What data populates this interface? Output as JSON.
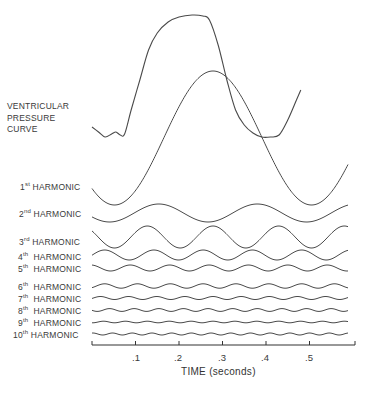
{
  "chart_data": {
    "type": "line",
    "title": "",
    "xlabel": "TIME (seconds)",
    "ylabel": "",
    "xlim": [
      0,
      0.59
    ],
    "x_ticks": [
      ".1",
      ".2",
      ".3",
      ".4",
      ".5"
    ],
    "x_tick_values": [
      0.1,
      0.2,
      0.3,
      0.4,
      0.5
    ],
    "grid": false,
    "legend": "none (labels at left of each trace)",
    "series": [
      {
        "name": "VENTRICULAR PRESSURE CURVE",
        "label_lines": [
          "VENTRICULAR",
          "PRESSURE",
          "CURVE"
        ],
        "points": [
          [
            0,
            127
          ],
          [
            0.015,
            132
          ],
          [
            0.03,
            137
          ],
          [
            0.045,
            134
          ],
          [
            0.055,
            132
          ],
          [
            0.065,
            135
          ],
          [
            0.075,
            134
          ],
          [
            0.09,
            110
          ],
          [
            0.11,
            80
          ],
          [
            0.13,
            50
          ],
          [
            0.15,
            33
          ],
          [
            0.175,
            22
          ],
          [
            0.2,
            17
          ],
          [
            0.23,
            15
          ],
          [
            0.255,
            16
          ],
          [
            0.27,
            20
          ],
          [
            0.29,
            45
          ],
          [
            0.31,
            80
          ],
          [
            0.33,
            110
          ],
          [
            0.35,
            125
          ],
          [
            0.37,
            133
          ],
          [
            0.39,
            137
          ],
          [
            0.41,
            137
          ],
          [
            0.43,
            135
          ],
          [
            0.45,
            120
          ],
          [
            0.47,
            100
          ],
          [
            0.48,
            90
          ]
        ]
      },
      {
        "name": "1st HARMONIC",
        "ord": "1",
        "suf": "st",
        "center": 138,
        "amp": 67,
        "harmonic": 1
      },
      {
        "name": "2nd HARMONIC",
        "ord": "2",
        "suf": "nd",
        "center": 213,
        "amp": 9,
        "harmonic": 2
      },
      {
        "name": "3rd HARMONIC",
        "ord": "3",
        "suf": "rd",
        "center": 237,
        "amp": 11,
        "harmonic": 3
      },
      {
        "name": "4th HARMONIC",
        "ord": "4",
        "suf": "th",
        "center": 255,
        "amp": 5,
        "harmonic": 4
      },
      {
        "name": "5th HARMONIC",
        "ord": "5",
        "suf": "th",
        "center": 268,
        "amp": 3,
        "harmonic": 5
      },
      {
        "name": "6th HARMONIC",
        "ord": "6",
        "suf": "th",
        "center": 286,
        "amp": 2.2,
        "harmonic": 6
      },
      {
        "name": "7th HARMONIC",
        "ord": "7",
        "suf": "th",
        "center": 298,
        "amp": 1.5,
        "harmonic": 7
      },
      {
        "name": "8th HARMONIC",
        "ord": "8",
        "suf": "th",
        "center": 310,
        "amp": 1.4,
        "harmonic": 8
      },
      {
        "name": "9th HARMONIC",
        "ord": "9",
        "suf": "th",
        "center": 322,
        "amp": 0.8,
        "harmonic": 9
      },
      {
        "name": "10th HARMONIC",
        "ord": "10",
        "suf": "th",
        "center": 334,
        "amp": 1.0,
        "harmonic": 10
      }
    ]
  },
  "labels": {
    "pressure": [
      "VENTRICULAR",
      "PRESSURE",
      "CURVE"
    ],
    "harmonic_word": "HARMONIC",
    "h1": {
      "ord": "1",
      "suf": "st"
    },
    "h2": {
      "ord": "2",
      "suf": "nd"
    },
    "h3": {
      "ord": "3",
      "suf": "rd"
    },
    "h4": {
      "ord": "4",
      "suf": "th"
    },
    "h5": {
      "ord": "5",
      "suf": "th"
    },
    "h6": {
      "ord": "6",
      "suf": "th"
    },
    "h7": {
      "ord": "7",
      "suf": "th"
    },
    "h8": {
      "ord": "8",
      "suf": "th"
    },
    "h9": {
      "ord": "9",
      "suf": "th"
    },
    "h10": {
      "ord": "10",
      "suf": "th"
    },
    "ticks": [
      ".1",
      ".2",
      ".3",
      ".4",
      ".5"
    ],
    "xtitle": "TIME (seconds)"
  },
  "colors": {
    "line": "#4a4a4a",
    "text": "#3a3a3a",
    "background": "#ffffff"
  }
}
